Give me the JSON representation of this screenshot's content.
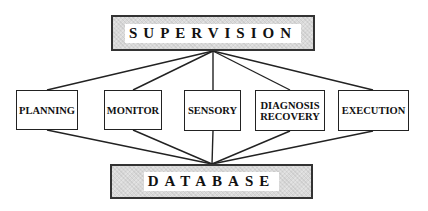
{
  "diagram": {
    "top": {
      "label": "SUPERVISION"
    },
    "bottom": {
      "label": "DATABASE"
    },
    "modules": [
      {
        "label": "PLANNING"
      },
      {
        "label": "MONITOR"
      },
      {
        "label": "SENSORY"
      },
      {
        "label": "DIAGNOSIS\nRECOVERY",
        "line1": "DIAGNOSIS",
        "line2": "RECOVERY"
      },
      {
        "label": "EXECUTION"
      }
    ],
    "colors": {
      "line": "#222222",
      "shade": "#d9d9d9"
    }
  }
}
